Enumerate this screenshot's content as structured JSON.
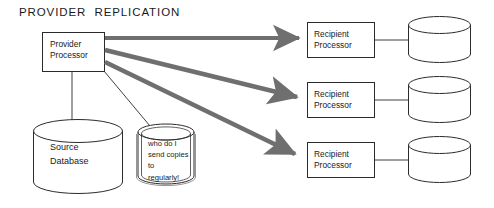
{
  "diagram": {
    "title": "PROVIDER  REPLICATION",
    "colors": {
      "stroke": "#2b2b2b",
      "arrow": "#6f6f6f",
      "text": "#1a1a1a",
      "background": "#ffffff"
    },
    "provider": {
      "label": "Provider\nProcessor",
      "name": "provider-processor-box"
    },
    "source_database": {
      "label": "Source\nDatabase",
      "name": "source-database-cylinder"
    },
    "thought_bubble": {
      "label": "who do I\nsend copies\nto\nregularly!",
      "name": "thought-bubble"
    },
    "recipients": [
      {
        "processor_label": "Recipient\nProcessor",
        "database_label": ""
      },
      {
        "processor_label": "Recipient\nProcessor",
        "database_label": ""
      },
      {
        "processor_label": "Recipient\nProcessor",
        "database_label": ""
      }
    ],
    "arrows": [
      {
        "from": "provider-processor",
        "to": "recipient-processor-1"
      },
      {
        "from": "provider-processor",
        "to": "recipient-processor-2"
      },
      {
        "from": "provider-processor",
        "to": "recipient-processor-3"
      }
    ],
    "connectors": [
      {
        "from": "provider-processor",
        "to": "source-database"
      },
      {
        "from": "provider-processor",
        "to": "thought-bubble"
      },
      {
        "from": "recipient-processor-1",
        "to": "recipient-database-1"
      },
      {
        "from": "recipient-processor-2",
        "to": "recipient-database-2"
      },
      {
        "from": "recipient-processor-3",
        "to": "recipient-database-3"
      }
    ]
  }
}
